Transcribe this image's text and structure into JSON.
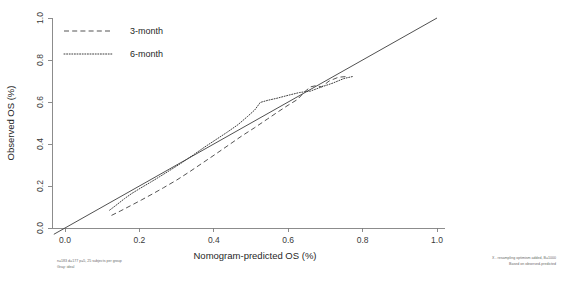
{
  "chart_data": {
    "type": "line",
    "title": "",
    "xlabel": "Nomogram-predicted OS (%)",
    "ylabel": "Observed OS (%)",
    "xlim": [
      0.0,
      1.0
    ],
    "ylim": [
      0.0,
      1.0
    ],
    "xticks": [
      "0.0",
      "0.2",
      "0.4",
      "0.6",
      "0.8",
      "1.0"
    ],
    "xtick_values": [
      0.0,
      0.2,
      0.4,
      0.6,
      0.8,
      1.0
    ],
    "yticks": [
      "0.0",
      "0.2",
      "0.4",
      "0.6",
      "0.8",
      "1.0"
    ],
    "ytick_values": [
      0.0,
      0.2,
      0.4,
      0.6,
      0.8,
      1.0
    ],
    "grid": false,
    "legend_position": "top-left",
    "reference_line": {
      "name": "ideal",
      "style": "solid",
      "x": [
        -0.03,
        1.0
      ],
      "y": [
        -0.03,
        1.0
      ]
    },
    "series": [
      {
        "name": "3-month",
        "style": "dashed",
        "x": [
          0.125,
          0.15,
          0.175,
          0.205,
          0.235,
          0.265,
          0.3,
          0.335,
          0.37,
          0.405,
          0.44,
          0.475,
          0.51,
          0.545,
          0.575,
          0.6,
          0.625,
          0.645,
          0.66,
          0.675,
          0.69,
          0.71,
          0.735,
          0.762
        ],
        "y": [
          0.06,
          0.082,
          0.105,
          0.133,
          0.162,
          0.192,
          0.228,
          0.268,
          0.31,
          0.352,
          0.395,
          0.438,
          0.478,
          0.52,
          0.556,
          0.585,
          0.612,
          0.65,
          0.672,
          0.678,
          0.672,
          0.7,
          0.718,
          0.722
        ]
      },
      {
        "name": "6-month",
        "style": "dotted",
        "x": [
          0.12,
          0.14,
          0.16,
          0.18,
          0.205,
          0.23,
          0.255,
          0.285,
          0.315,
          0.345,
          0.375,
          0.405,
          0.435,
          0.465,
          0.49,
          0.51,
          0.525,
          0.545,
          0.57,
          0.6,
          0.63,
          0.66,
          0.69,
          0.72,
          0.75,
          0.775
        ],
        "y": [
          0.085,
          0.112,
          0.14,
          0.165,
          0.192,
          0.218,
          0.245,
          0.278,
          0.312,
          0.348,
          0.385,
          0.42,
          0.455,
          0.492,
          0.53,
          0.562,
          0.598,
          0.608,
          0.618,
          0.632,
          0.645,
          0.652,
          0.672,
          0.69,
          0.712,
          0.722
        ]
      }
    ],
    "legend": [
      {
        "label": "3-month",
        "style": "dashed"
      },
      {
        "label": "6-month",
        "style": "dotted"
      }
    ],
    "annotations": {
      "bottom_left_line1": "n=183 d=177 p=5, 25 subjects per group",
      "bottom_left_line2": "Gray: ideal",
      "bottom_right_line1": "X - resampling optimism added, B=1000",
      "bottom_right_line2": "Based on observed-predicted"
    }
  }
}
